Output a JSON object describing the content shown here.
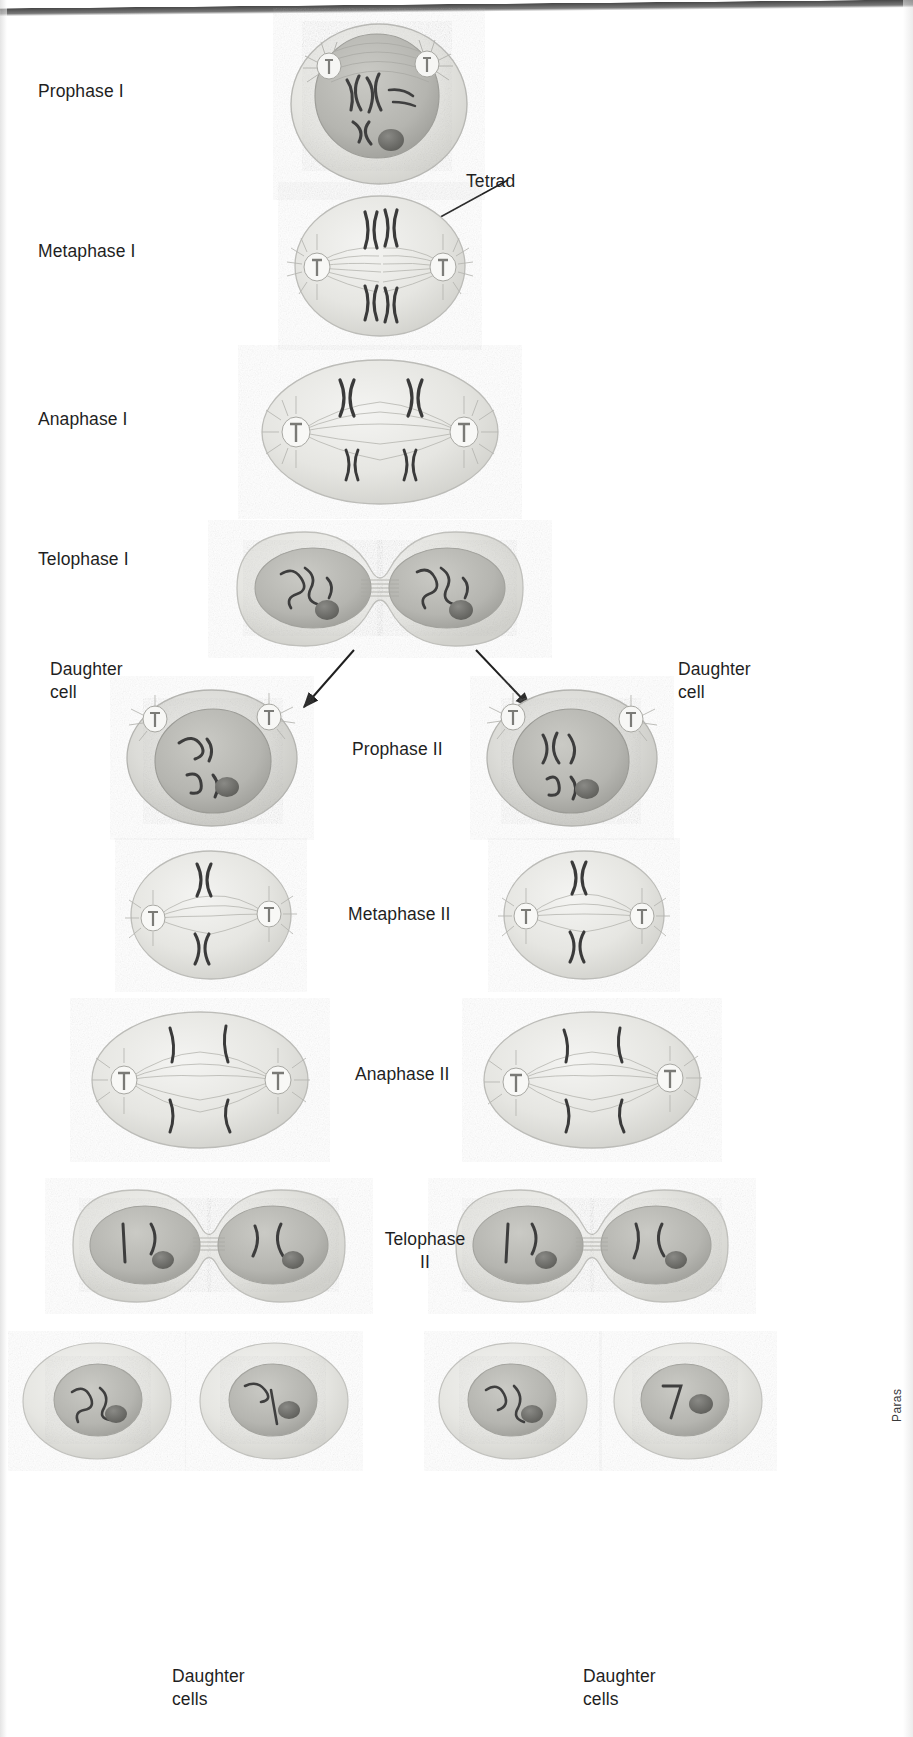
{
  "figure": {
    "credit_text": "Paras"
  },
  "stage_labels": [
    {
      "id": "prophase-1",
      "text": "Prophase I",
      "x": 38,
      "y": 80,
      "align": "left"
    },
    {
      "id": "metaphase-1",
      "text": "Metaphase I",
      "x": 38,
      "y": 240,
      "align": "left"
    },
    {
      "id": "anaphase-1",
      "text": "Anaphase I",
      "x": 38,
      "y": 408,
      "align": "left"
    },
    {
      "id": "telophase-1",
      "text": "Telophase I",
      "x": 38,
      "y": 548,
      "align": "left"
    },
    {
      "id": "prophase-2",
      "text": "Prophase II",
      "x": 352,
      "y": 738,
      "align": "left"
    },
    {
      "id": "metaphase-2",
      "text": "Metaphase II",
      "x": 348,
      "y": 903,
      "align": "left"
    },
    {
      "id": "anaphase-2",
      "text": "Anaphase II",
      "x": 355,
      "y": 1063,
      "align": "left"
    },
    {
      "id": "telophase-2",
      "text": "Telophase\nII",
      "x": 388,
      "y": 1228,
      "align": "center"
    }
  ],
  "callouts": [
    {
      "id": "tetrad",
      "text": "Tetrad",
      "x": 466,
      "y": 170
    }
  ],
  "daughter_labels": [
    {
      "id": "daughter-cell-left",
      "text": "Daughter\ncell",
      "x": 50,
      "y": 658
    },
    {
      "id": "daughter-cell-right",
      "text": "Daughter\ncell",
      "x": 678,
      "y": 658
    },
    {
      "id": "daughter-cells-left",
      "text": "Daughter\ncells",
      "x": 172,
      "y": 1665
    },
    {
      "id": "daughter-cells-right",
      "text": "Daughter\ncells",
      "x": 583,
      "y": 1665
    }
  ],
  "palette": {
    "cytoplasm": "#e9e9e6",
    "cytoplasm_dark": "#d5d5d1",
    "nucleus": "#bdbdb8",
    "nucleus_dark": "#a9a9a4",
    "nucleolus": "#6e6e6a",
    "chromosome": "#4a4a4a",
    "spindle": "#9a9a96",
    "outline": "#b6b6b2",
    "text": "#1f1f1f"
  },
  "cells": [
    {
      "id": "cell-prophase-1",
      "stage": "Prophase I",
      "cx": 379,
      "cy": 100,
      "rx": 86,
      "ry": 72
    },
    {
      "id": "cell-metaphase-1",
      "stage": "Metaphase I",
      "cx": 379,
      "cy": 265,
      "rx": 84,
      "ry": 70
    },
    {
      "id": "cell-anaphase-1",
      "stage": "Anaphase I",
      "cx": 379,
      "cy": 430,
      "rx": 112,
      "ry": 74
    },
    {
      "id": "cell-telophase-1",
      "stage": "Telophase I",
      "cx": 379,
      "cy": 588,
      "rx": 148,
      "ry": 62
    },
    {
      "id": "cell-prophase-2-left",
      "stage": "Prophase II",
      "cx": 211,
      "cy": 757,
      "rx": 88,
      "ry": 72
    },
    {
      "id": "cell-prophase-2-right",
      "stage": "Prophase II",
      "cx": 571,
      "cy": 757,
      "rx": 88,
      "ry": 72
    },
    {
      "id": "cell-metaphase-2-left",
      "stage": "Metaphase II",
      "cx": 205,
      "cy": 913,
      "rx": 80,
      "ry": 68
    },
    {
      "id": "cell-metaphase-2-right",
      "stage": "Metaphase II",
      "cx": 578,
      "cy": 913,
      "rx": 80,
      "ry": 68
    },
    {
      "id": "cell-anaphase-2-left",
      "stage": "Anaphase II",
      "cx": 196,
      "cy": 1078,
      "rx": 106,
      "ry": 70
    },
    {
      "id": "cell-anaphase-2-right",
      "stage": "Anaphase II",
      "cx": 588,
      "cy": 1078,
      "rx": 106,
      "ry": 70
    },
    {
      "id": "cell-telophase-2-left",
      "stage": "Telophase II",
      "cx": 205,
      "cy": 1245,
      "rx": 140,
      "ry": 60
    },
    {
      "id": "cell-telophase-2-right",
      "stage": "Telophase II",
      "cx": 588,
      "cy": 1245,
      "rx": 140,
      "ry": 60
    },
    {
      "id": "cell-daughter-1",
      "stage": "Daughter cell",
      "cx": 96,
      "cy": 1400,
      "rx": 78,
      "ry": 62
    },
    {
      "id": "cell-daughter-2",
      "stage": "Daughter cell",
      "cx": 273,
      "cy": 1400,
      "rx": 78,
      "ry": 62
    },
    {
      "id": "cell-daughter-3",
      "stage": "Daughter cell",
      "cx": 512,
      "cy": 1400,
      "rx": 78,
      "ry": 62
    },
    {
      "id": "cell-daughter-4",
      "stage": "Daughter cell",
      "cx": 687,
      "cy": 1400,
      "rx": 78,
      "ry": 62
    }
  ],
  "arrows": [
    {
      "id": "arrow-telophase1-to-left",
      "x1": 300,
      "y1": 652,
      "x2": 249,
      "y2": 712
    },
    {
      "id": "arrow-telophase1-to-right",
      "x1": 470,
      "y1": 652,
      "x2": 532,
      "y2": 712
    }
  ]
}
